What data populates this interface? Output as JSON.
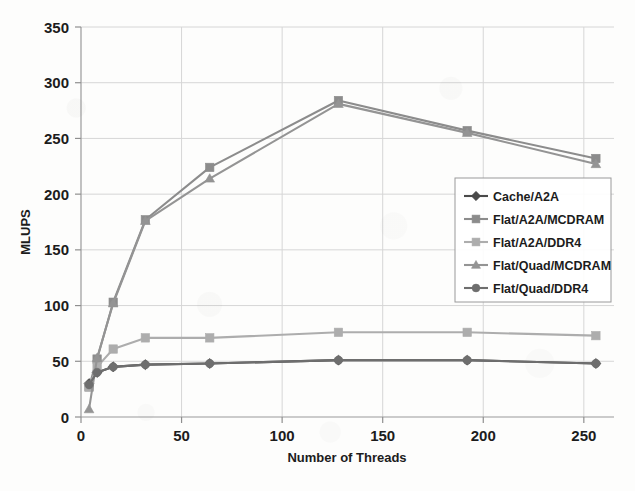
{
  "chart_data": {
    "type": "line",
    "title": "",
    "xlabel": "Number of Threads",
    "ylabel": "MLUPS",
    "xlim": [
      0,
      265
    ],
    "ylim": [
      0,
      350
    ],
    "xticks": [
      0,
      50,
      100,
      150,
      200,
      250
    ],
    "yticks": [
      0,
      50,
      100,
      150,
      200,
      250,
      300,
      350
    ],
    "grid": true,
    "legend_position": "center-right",
    "x": [
      4,
      8,
      16,
      32,
      64,
      128,
      192,
      256
    ],
    "series": [
      {
        "name": "Cache/A2A",
        "color": "#4a4a4a",
        "marker": "diamond",
        "values": [
          30,
          40,
          45,
          47,
          48,
          51,
          51,
          48
        ]
      },
      {
        "name": "Flat/A2A/MCDRAM",
        "color": "#8c8c8c",
        "marker": "square",
        "values": [
          27,
          52,
          103,
          177,
          224,
          284,
          257,
          232
        ]
      },
      {
        "name": "Flat/A2A/DDR4",
        "color": "#adadad",
        "marker": "square",
        "values": [
          27,
          45,
          61,
          71,
          71,
          76,
          76,
          73
        ]
      },
      {
        "name": "Flat/Quad/MCDRAM",
        "color": "#949494",
        "marker": "triangle",
        "values": [
          7,
          53,
          102,
          176,
          214,
          281,
          255,
          227
        ]
      },
      {
        "name": "Flat/Quad/DDR4",
        "color": "#6e6e6e",
        "marker": "circle",
        "values": [
          29,
          40,
          45,
          47,
          48,
          51,
          51,
          48
        ]
      }
    ]
  },
  "axes": {
    "y_tick_labels": [
      "350",
      "300",
      "250",
      "200",
      "150",
      "100",
      "50",
      "0"
    ],
    "x_tick_labels": [
      "0",
      "50",
      "100",
      "150",
      "200",
      "250"
    ],
    "y_axis_title": "MLUPS",
    "x_axis_title": "Number of Threads"
  },
  "legend": {
    "items": [
      {
        "label": "Cache/A2A"
      },
      {
        "label": "Flat/A2A/MCDRAM"
      },
      {
        "label": "Flat/A2A/DDR4"
      },
      {
        "label": "Flat/Quad/MCDRAM"
      },
      {
        "label": "Flat/Quad/DDR4"
      }
    ]
  }
}
